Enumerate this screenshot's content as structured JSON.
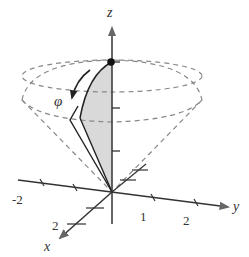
{
  "figure": {
    "type": "3d-spherical-coordinates-diagram",
    "axes": {
      "z": {
        "label": "z"
      },
      "y": {
        "label": "y",
        "ticks": [
          "-2",
          "1",
          "2"
        ]
      },
      "x": {
        "label": "x",
        "ticks": [
          "2"
        ]
      }
    },
    "angle_label": "φ",
    "colors": {
      "axis": "#333333",
      "dashed": "#888888",
      "shade": "#d9d9d9",
      "text": "#333333"
    }
  }
}
